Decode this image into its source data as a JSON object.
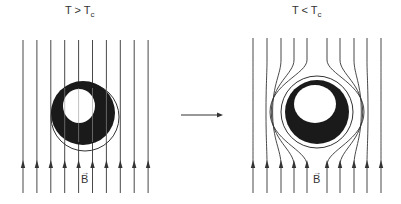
{
  "panels": [
    {
      "id": "normal",
      "label_main": "T > T",
      "label_sub": "c",
      "state": "T above critical temperature: field lines pass straight through the sphere",
      "field_label": "B",
      "field_lines": 10
    },
    {
      "id": "superconducting",
      "label_main": "T < T",
      "label_sub": "c",
      "state": "T below critical temperature: field lines are expelled around the sphere (Meissner effect)",
      "field_label": "B",
      "field_lines": 10
    }
  ],
  "transition_arrow": "cooling transition",
  "colors": {
    "ink": "#333333",
    "sphere": "#1a1a1a",
    "background": "#ffffff"
  }
}
